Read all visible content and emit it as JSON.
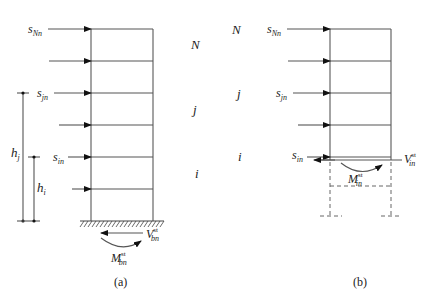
{
  "figure": {
    "panel_a": {
      "caption": "(a)",
      "level_labels": {
        "top": "N",
        "middle": "j",
        "bottom": "i"
      },
      "force_labels": {
        "top": {
          "base": "s",
          "sub": "Nn"
        },
        "middle": {
          "base": "s",
          "sub": "jn"
        },
        "bottom": {
          "base": "s",
          "sub": "in"
        }
      },
      "dimensions": {
        "hj": {
          "base": "h",
          "sub": "j"
        },
        "hi": {
          "base": "h",
          "sub": "i"
        }
      },
      "base_shear": {
        "base": "V",
        "sup": "st",
        "sub": "bn"
      },
      "base_moment": {
        "base": "M",
        "sup": "st",
        "sub": "bn"
      }
    },
    "panel_b": {
      "caption": "(b)",
      "level_labels": {
        "top": "N",
        "middle": "j",
        "bottom": "i"
      },
      "force_labels": {
        "top": {
          "base": "s",
          "sub": "Nn"
        },
        "middle": {
          "base": "s",
          "sub": "jn"
        },
        "bottom": {
          "base": "s",
          "sub": "in"
        }
      },
      "story_shear": {
        "base": "V",
        "sup": "st",
        "sub": "in"
      },
      "story_moment": {
        "base": "M",
        "sup": "st",
        "sub": "in"
      }
    }
  }
}
